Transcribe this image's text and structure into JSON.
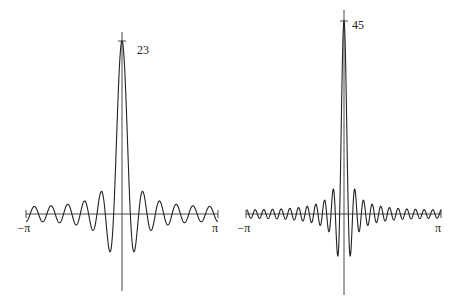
{
  "chart_data": [
    {
      "type": "line",
      "title": "",
      "function": "Dirichlet kernel D_N(x) = sin((N+1/2)x) / sin(x/2)",
      "N": 11,
      "peak_value": 23,
      "peak_label": "23",
      "x_range": [
        -3.14159,
        3.14159
      ],
      "x_tick_labels": [
        "−π",
        "π"
      ],
      "xlabel": "",
      "ylabel": "",
      "grid": false,
      "legend": null,
      "layout": {
        "x0": 26,
        "x1": 218,
        "cx": 122,
        "axis_y": 214,
        "peak_y": 41,
        "vaxis_top": 32,
        "vaxis_bottom": 291,
        "label_x": 137,
        "label_y": 54
      }
    },
    {
      "type": "line",
      "title": "",
      "function": "Dirichlet kernel D_N(x) = sin((N+1/2)x) / sin(x/2)",
      "N": 22,
      "peak_value": 45,
      "peak_label": "45",
      "x_range": [
        -3.14159,
        3.14159
      ],
      "x_tick_labels": [
        "−π",
        "π"
      ],
      "xlabel": "",
      "ylabel": "",
      "grid": false,
      "legend": null,
      "layout": {
        "x0": 246,
        "x1": 441,
        "cx": 344,
        "axis_y": 214,
        "peak_y": 21,
        "vaxis_top": 10,
        "vaxis_bottom": 295,
        "label_x": 352,
        "label_y": 29
      }
    }
  ]
}
